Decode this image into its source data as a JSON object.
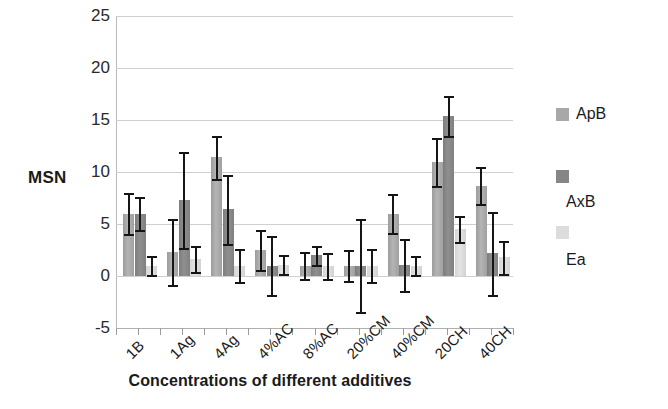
{
  "chart_data": {
    "type": "bar",
    "title": "",
    "xlabel": "Concentrations of different additives",
    "ylabel": "MSN",
    "ylim": [
      -5,
      25
    ],
    "yticks": [
      -5,
      0,
      5,
      10,
      15,
      20,
      25
    ],
    "grid": true,
    "legend_position": "right",
    "categories": [
      "1B",
      "1Ag",
      "4Ag",
      "4%AC",
      "8%AC",
      "20%CM",
      "40%CM",
      "20CH",
      "40CH"
    ],
    "series": [
      {
        "name": "ApB",
        "color": "#a8a8a8",
        "values": [
          6.0,
          2.3,
          11.4,
          2.5,
          1.0,
          1.0,
          6.0,
          11.0,
          8.7
        ],
        "errors": [
          2.0,
          3.2,
          2.1,
          1.9,
          1.3,
          1.5,
          1.9,
          2.3,
          1.8
        ]
      },
      {
        "name": "AxB",
        "color": "#868686",
        "values": [
          6.0,
          7.3,
          6.4,
          1.0,
          2.0,
          1.0,
          1.1,
          15.4,
          2.2
        ],
        "errors": [
          1.6,
          4.6,
          3.3,
          2.8,
          0.9,
          4.5,
          2.5,
          1.9,
          4.0
        ]
      },
      {
        "name": "Ea",
        "color": "#dcdcdc",
        "values": [
          1.0,
          1.6,
          1.0,
          1.1,
          1.0,
          1.0,
          1.0,
          4.5,
          1.8
        ]
      }
    ],
    "error_bars_present": true
  },
  "axis": {
    "y_title": "MSN",
    "y_tick_labels": [
      "25",
      "20",
      "15",
      "10",
      "5",
      "0",
      "-5"
    ],
    "x_title": "Concentrations of different additives",
    "x_tick_labels": [
      "1B",
      "1Ag",
      "4Ag",
      "4%AC",
      "8%AC",
      "20%CM",
      "40%CM",
      "20CH",
      "40CH"
    ]
  },
  "legend": {
    "items": [
      {
        "label": "ApB",
        "color": "#a8a8a8"
      },
      {
        "label": "AxB",
        "color": "#868686"
      },
      {
        "label": "Ea",
        "color": "#dcdcdc"
      }
    ]
  }
}
